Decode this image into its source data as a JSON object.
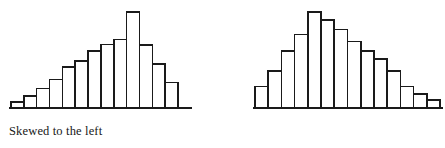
{
  "figure": {
    "background_color": "#ffffff",
    "ink_color": "#1a1a1a",
    "text_color": "#171717"
  },
  "panels": [
    {
      "id": "left",
      "caption": "Skewed to the left"
    },
    {
      "id": "right",
      "caption": "Skewed to the right"
    }
  ],
  "chart_data": [
    {
      "type": "bar",
      "title": "Skewed to the left",
      "subtitle": "",
      "xlabel": "",
      "ylabel": "",
      "categories": [
        "1",
        "2",
        "3",
        "4",
        "5",
        "6",
        "7",
        "8",
        "9",
        "10",
        "11",
        "12",
        "13"
      ],
      "values": [
        6,
        12,
        20,
        29,
        42,
        48,
        58,
        65,
        70,
        98,
        64,
        45,
        26
      ],
      "ylim": [
        0,
        100
      ],
      "xlim": [
        0,
        13
      ],
      "grid": false,
      "legend": false,
      "axis": {
        "baseline_only": true,
        "tick_labels": false
      },
      "annotations": [],
      "notes": "Negatively skewed histogram: long gradual tail on the left, sharp peak near the right, steep drop after the mode."
    },
    {
      "type": "bar",
      "title": "Skewed to the right",
      "subtitle": "",
      "xlabel": "",
      "ylabel": "",
      "categories": [
        "1",
        "2",
        "3",
        "4",
        "5",
        "6",
        "7",
        "8",
        "9",
        "10",
        "11",
        "12",
        "13",
        "14"
      ],
      "values": [
        22,
        38,
        58,
        75,
        98,
        90,
        80,
        68,
        58,
        50,
        38,
        22,
        14,
        8
      ],
      "ylim": [
        0,
        100
      ],
      "xlim": [
        0,
        14
      ],
      "grid": false,
      "legend": false,
      "axis": {
        "baseline_only": true,
        "tick_labels": false
      },
      "annotations": [],
      "notes": "Positively skewed histogram: sharp rise to a peak near the left, long gradual tail trailing off to the right."
    }
  ]
}
